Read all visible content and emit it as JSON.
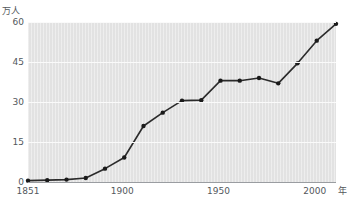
{
  "chart_data": {
    "type": "line",
    "title": "",
    "xlabel": "年",
    "ylabel": "万人",
    "xlim": [
      1851,
      2011
    ],
    "ylim": [
      0,
      60
    ],
    "grid": true,
    "legend": "none",
    "yticks": [
      0,
      15,
      30,
      45,
      60
    ],
    "ytick_labels": [
      "0",
      "15",
      "30",
      "45",
      "60"
    ],
    "xticks": [
      1851,
      1900,
      1950,
      2000
    ],
    "xtick_labels": [
      "1851",
      "1900",
      "1950",
      "2000"
    ],
    "marker": "filled-circle",
    "line_color": "#2b2b2b",
    "marker_color": "#1a1a1a",
    "plot_background": "#e2e2e2",
    "gridline_color": "#fafafa",
    "x": [
      1851,
      1861,
      1871,
      1881,
      1891,
      1901,
      1911,
      1921,
      1931,
      1941,
      1951,
      1961,
      1971,
      1981,
      1991,
      2001,
      2011
    ],
    "values": [
      0.5,
      0.7,
      0.9,
      1.5,
      5.0,
      9.2,
      21.0,
      26.0,
      30.5,
      30.7,
      38.0,
      38.0,
      39.0,
      37.0,
      44.5,
      53.0,
      59.3
    ],
    "series": [
      {
        "name": "人口",
        "values": [
          0.5,
          0.7,
          0.9,
          1.5,
          5.0,
          9.2,
          21.0,
          26.0,
          30.5,
          30.7,
          38.0,
          38.0,
          39.0,
          37.0,
          44.5,
          53.0,
          59.3
        ]
      }
    ]
  },
  "axes": {
    "y_unit_label": "万人",
    "x_unit_label": "年"
  },
  "title_sliver": ""
}
